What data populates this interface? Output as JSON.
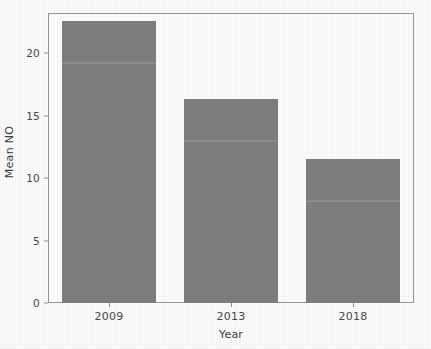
{
  "chart_data": {
    "type": "bar",
    "title": "",
    "xlabel": "Year",
    "ylabel": "Mean NO",
    "categories": [
      "2009",
      "2013",
      "2018"
    ],
    "values": [
      22.6,
      16.3,
      11.5
    ],
    "ylim": [
      0,
      23.2
    ],
    "yticks": [
      "0",
      "5",
      "10",
      "15",
      "20"
    ],
    "ytick_values": [
      0,
      5,
      10,
      15,
      20
    ],
    "grid": false,
    "legend": null,
    "bar_color": "#808080",
    "axis_color": "#9a9a9a",
    "background_color": "#ffffff"
  },
  "figure": {
    "title_remnant": "",
    "axis_label_y": "Mean NO",
    "axis_label_x": "Year"
  }
}
